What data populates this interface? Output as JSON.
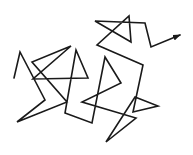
{
  "diagram": {
    "type": "random-walk-path",
    "stroke_color": "#1a1a1a",
    "background": "#ffffff",
    "stroke_width": 1.6,
    "points": [
      [
        14,
        78
      ],
      [
        20,
        52
      ],
      [
        45,
        100
      ],
      [
        17,
        122
      ],
      [
        67,
        102
      ],
      [
        32,
        62
      ],
      [
        71,
        46
      ],
      [
        33,
        79
      ],
      [
        88,
        78
      ],
      [
        76,
        50
      ],
      [
        65,
        113
      ],
      [
        92,
        123
      ],
      [
        105,
        57
      ],
      [
        121,
        83
      ],
      [
        82,
        102
      ],
      [
        136,
        118
      ],
      [
        106,
        142
      ],
      [
        135,
        97
      ],
      [
        158,
        106
      ],
      [
        133,
        112
      ],
      [
        143,
        65
      ],
      [
        97,
        45
      ],
      [
        129,
        16
      ],
      [
        131,
        42
      ],
      [
        95,
        21
      ],
      [
        145,
        23
      ],
      [
        151,
        47
      ],
      [
        180,
        35
      ]
    ],
    "end_marker": "arrow-icon"
  }
}
